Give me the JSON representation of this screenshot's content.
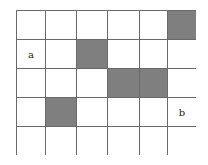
{
  "grid": {
    "rows": 5,
    "cols": 6,
    "shaded_color": "#7f7f7f",
    "line_color": "#6a6a6a",
    "shaded_cells": [
      [
        0,
        5
      ],
      [
        1,
        2
      ],
      [
        2,
        3
      ],
      [
        2,
        4
      ],
      [
        3,
        1
      ]
    ],
    "labels": [
      {
        "row": 1,
        "col": 0,
        "text": "a"
      },
      {
        "row": 3,
        "col": 5,
        "text": "b"
      }
    ]
  }
}
